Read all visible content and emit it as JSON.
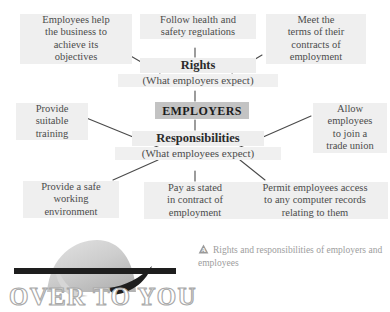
{
  "diagram": {
    "type": "mind-map",
    "center": {
      "label": "EMPLOYERS"
    },
    "hubs": [
      {
        "id": "rights",
        "title": "Rights",
        "subtitle": "(What employers expect)"
      },
      {
        "id": "responsibilities",
        "title": "Responsibilities",
        "subtitle": "(What employees expect)"
      }
    ],
    "nodes": [
      {
        "id": "employees-help",
        "text": "Employees help\nthe business to\nachieve its\nobjectives",
        "parent": "rights"
      },
      {
        "id": "follow-health-safety",
        "text": "Follow health and\nsafety regulations",
        "parent": "rights"
      },
      {
        "id": "meet-terms",
        "text": "Meet the\nterms of their\ncontracts of\nemployment",
        "parent": "rights"
      },
      {
        "id": "provide-training",
        "text": "Provide\nsuitable\ntraining",
        "parent": "responsibilities"
      },
      {
        "id": "allow-trade-union",
        "text": "Allow\nemployees\nto join a\ntrade union",
        "parent": "responsibilities"
      },
      {
        "id": "safe-working",
        "text": "Provide a safe\nworking\nenvironment",
        "parent": "responsibilities"
      },
      {
        "id": "pay-as-stated",
        "text": "Pay as stated\nin contract of\nemployment",
        "parent": "responsibilities"
      },
      {
        "id": "permit-records",
        "text": "Permit employees access\nto any computer records\nrelating to them",
        "parent": "responsibilities"
      }
    ]
  },
  "caption": {
    "icon": "triangle-a-icon",
    "text": "Rights and responsibilities of employers and employees"
  },
  "banner": {
    "heading": "OVER TO YOU",
    "graphic": "hill-swoosh-graphic"
  },
  "colors": {
    "node_highlight": "#efefef",
    "center_box": "#c3c3c3",
    "text": "#4c4c4c",
    "caption_text": "#9d9d9d",
    "connector": "#4a4a4a",
    "banner_outline": "#a9a9a9",
    "graphic_gray": "#c9c9c9",
    "graphic_dark": "#1e1e1e"
  }
}
